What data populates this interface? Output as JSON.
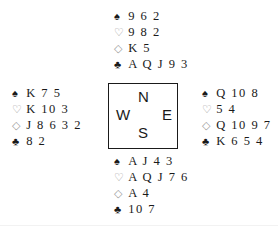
{
  "suit_symbols": {
    "spades": "♠",
    "hearts": "♡",
    "diamonds": "◇",
    "clubs": "♣"
  },
  "hands": {
    "north": {
      "spades": "9 6 2",
      "hearts": "9 8 2",
      "diamonds": "K 5",
      "clubs": "A Q J 9 3"
    },
    "west": {
      "spades": "K 7 5",
      "hearts": "K 10 3",
      "diamonds": "J 8 6 3 2",
      "clubs": "8 2"
    },
    "east": {
      "spades": "Q 10 8",
      "hearts": "5 4",
      "diamonds": "Q 10 9 7",
      "clubs": "K 6 5 4"
    },
    "south": {
      "spades": "A J 4 3",
      "hearts": "A Q J 7 6",
      "diamonds": "A 4",
      "clubs": "10 7"
    }
  },
  "compass": {
    "north": "N",
    "west": "W",
    "east": "E",
    "south": "S"
  }
}
